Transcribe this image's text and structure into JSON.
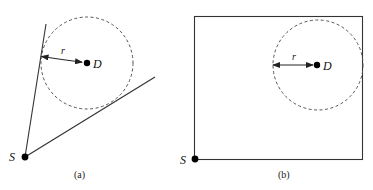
{
  "panels": [
    {
      "id": "a",
      "caption": "(a)",
      "source_label": "S",
      "destination_label": "D",
      "radius_label": "r",
      "boundary": "two lines from S forming a wedge tangent to the circle"
    },
    {
      "id": "b",
      "caption": "(b)",
      "source_label": "S",
      "destination_label": "D",
      "radius_label": "r",
      "boundary": "rectangle with S at bottom-left corner; circle touches top and right edges"
    }
  ],
  "colors": {
    "stroke": "#333333",
    "dashed_circle": "#555555",
    "dot": "#000000"
  }
}
